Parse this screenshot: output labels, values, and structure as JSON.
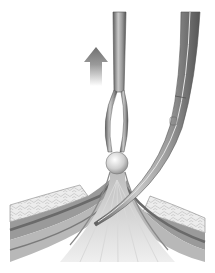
{
  "figure": {
    "elements": [
      {
        "name": "up-arrow",
        "meaning": "lift direction"
      },
      {
        "name": "grasping-forceps"
      },
      {
        "name": "tissue-knob"
      },
      {
        "name": "curved-scissors"
      },
      {
        "name": "tissue-layers"
      }
    ],
    "colors": {
      "arrow_top": "#7a7a7a",
      "arrow_bottom": "#ffffff",
      "metal_dark": "#6e6e6e",
      "metal_light": "#d8d8d8",
      "fat_layer": "#e4e4e4",
      "muscle_dark": "#8a8a8a",
      "muscle_mid": "#a8a8a8",
      "fascia": "#d0d0d0",
      "background": "#ffffff"
    }
  },
  "caption": {
    "text": ""
  }
}
